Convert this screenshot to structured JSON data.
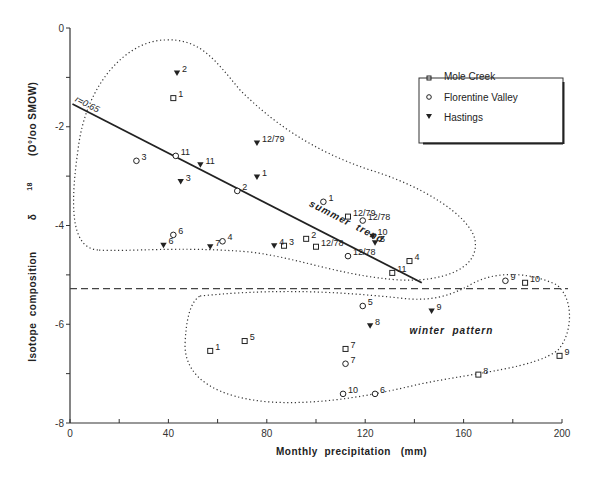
{
  "chart_data": {
    "type": "scatter",
    "title": "",
    "xlabel": "Monthly  precipitation   (mm)",
    "ylabel": "Isotope  composition   δ18 (O°/oo SMOW)",
    "xlim": [
      0,
      200
    ],
    "ylim": [
      -8,
      0
    ],
    "x_ticks": [
      0,
      40,
      80,
      120,
      160,
      200
    ],
    "x_minor_ticks": [
      20,
      60,
      100,
      140,
      180
    ],
    "y_ticks": [
      0,
      -2,
      -4,
      -6,
      -8
    ],
    "y_minor_ticks": [
      -1,
      -3,
      -5,
      -7
    ],
    "grid": false,
    "legend_position": "upper right",
    "legend": [
      {
        "name": "Mole Creek",
        "marker": "square-open"
      },
      {
        "name": "Florentine Valley",
        "marker": "circle-open"
      },
      {
        "name": "Hastings",
        "marker": "triangle-down-filled"
      }
    ],
    "series": [
      {
        "name": "Mole Creek",
        "marker": "square-open",
        "points": [
          {
            "x": 42,
            "y": -1.42,
            "label": "1"
          },
          {
            "x": 113,
            "y": -3.82,
            "label": "12/79"
          },
          {
            "x": 96,
            "y": -4.27,
            "label": "2"
          },
          {
            "x": 87,
            "y": -4.41,
            "label": "3"
          },
          {
            "x": 100,
            "y": -4.43,
            "label": "12/78"
          },
          {
            "x": 138,
            "y": -4.72,
            "label": "4"
          },
          {
            "x": 131,
            "y": -4.96,
            "label": "11"
          },
          {
            "x": 185,
            "y": -5.16,
            "label": "10"
          },
          {
            "x": 57,
            "y": -6.54,
            "label": "1"
          },
          {
            "x": 71,
            "y": -6.34,
            "label": "5"
          },
          {
            "x": 112,
            "y": -6.5,
            "label": "7"
          },
          {
            "x": 166,
            "y": -7.02,
            "label": "8"
          },
          {
            "x": 199,
            "y": -6.64,
            "label": "9"
          }
        ]
      },
      {
        "name": "Florentine Valley",
        "marker": "circle-open",
        "points": [
          {
            "x": 27,
            "y": -2.69,
            "label": "3"
          },
          {
            "x": 43,
            "y": -2.59,
            "label": "11"
          },
          {
            "x": 68,
            "y": -3.3,
            "label": "2"
          },
          {
            "x": 103,
            "y": -3.52,
            "label": "1"
          },
          {
            "x": 119,
            "y": -3.9,
            "label": "12/78"
          },
          {
            "x": 42,
            "y": -4.19,
            "label": "6"
          },
          {
            "x": 62,
            "y": -4.32,
            "label": "4"
          },
          {
            "x": 113,
            "y": -4.62,
            "label": "12/78"
          },
          {
            "x": 177,
            "y": -5.12,
            "label": "9"
          },
          {
            "x": 119,
            "y": -5.63,
            "label": "5"
          },
          {
            "x": 112,
            "y": -6.8,
            "label": "7"
          },
          {
            "x": 111,
            "y": -7.41,
            "label": "10"
          },
          {
            "x": 124,
            "y": -7.41,
            "label": "6"
          }
        ]
      },
      {
        "name": "Hastings",
        "marker": "triangle-down-filled",
        "points": [
          {
            "x": 43.5,
            "y": -0.91,
            "label": "2"
          },
          {
            "x": 76,
            "y": -2.33,
            "label": "12/79"
          },
          {
            "x": 53,
            "y": -2.77,
            "label": "11"
          },
          {
            "x": 76,
            "y": -3.02,
            "label": "1"
          },
          {
            "x": 45,
            "y": -3.11,
            "label": "3"
          },
          {
            "x": 123,
            "y": -4.22,
            "label": "10"
          },
          {
            "x": 124,
            "y": -4.35,
            "label": "5"
          },
          {
            "x": 38,
            "y": -4.4,
            "label": "6"
          },
          {
            "x": 57,
            "y": -4.43,
            "label": "7"
          },
          {
            "x": 83,
            "y": -4.41,
            "label": "4"
          },
          {
            "x": 147,
            "y": -5.73,
            "label": "9"
          },
          {
            "x": 122,
            "y": -6.03,
            "label": "8"
          }
        ]
      }
    ],
    "regression_line": {
      "x": [
        1,
        143
      ],
      "y": [
        -1.54,
        -5.16
      ],
      "label": "r=0.65"
    },
    "threshold_line": {
      "y": -5.28,
      "style": "dashed"
    },
    "annotations": [
      {
        "text": "summer  trend",
        "x": 97,
        "y": -3.6,
        "rotation": 27
      },
      {
        "text": "winter  pattern",
        "x": 138,
        "y": -6.2
      }
    ]
  },
  "labels": {
    "xlabel": "Monthly  precipitation   (mm)",
    "ylabel_main": "Isotope  composition",
    "ylabel_delta": "δ",
    "ylabel_sup": "18",
    "ylabel_unit": "(O°/oo SMOW)",
    "r_label": "r=0.65",
    "summer": "summer  trend",
    "winter": "winter  pattern"
  }
}
